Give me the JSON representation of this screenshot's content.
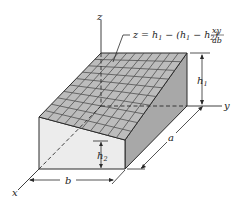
{
  "figure": {
    "axes": {
      "x": "x",
      "y": "y",
      "z": "z"
    },
    "equation": {
      "lhs": "z = h",
      "sub1": "1",
      "mid": " − (h",
      "sub2": "1",
      "mid2": " − h",
      "sub3": "2",
      "close": ")",
      "frac_num": "xy",
      "frac_den": "ab"
    },
    "dimensions": {
      "h1": "h",
      "h1_sub": "1",
      "h2": "h",
      "h2_sub": "2",
      "a": "a",
      "b": "b"
    },
    "colors": {
      "top": "#b9b9b9",
      "grid": "#4a4a4a",
      "right_face": "#a6a6a6",
      "front_face": "#ececec",
      "edge": "#2a2a2a"
    }
  }
}
